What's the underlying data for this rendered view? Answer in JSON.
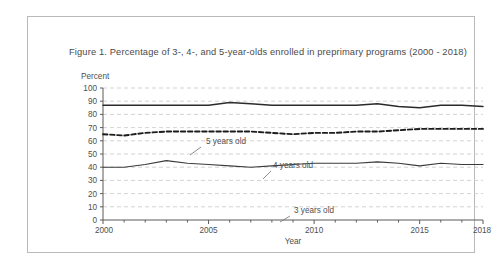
{
  "figure": {
    "title": "Figure 1.  Percentage of 3-, 4-, and 5-year-olds enrolled in preprimary programs (2000 - 2018)",
    "border_color": "#b9b9b9",
    "background": "#ffffff"
  },
  "chart_data": {
    "type": "line",
    "title": "Figure 1.  Percentage of 3-, 4-, and 5-year-olds enrolled in preprimary programs (2000 - 2018)",
    "xlabel": "Year",
    "ylabel": "Percent",
    "ylim": [
      0,
      100
    ],
    "xlim": [
      2000,
      2018
    ],
    "ytick_step": 10,
    "yticks": [
      0,
      10,
      20,
      30,
      40,
      50,
      60,
      70,
      80,
      90,
      100
    ],
    "xticks_major": [
      2000,
      2005,
      2010,
      2015,
      2018
    ],
    "xticks_minor_every": 1,
    "grid": "horizontal-dashed",
    "grid_color": "#c8c8c8",
    "legend": "inline-annotations",
    "x": [
      2000,
      2001,
      2002,
      2003,
      2004,
      2005,
      2006,
      2007,
      2008,
      2009,
      2010,
      2011,
      2012,
      2013,
      2014,
      2015,
      2016,
      2017,
      2018
    ],
    "series": [
      {
        "name": "5 years old",
        "style": "solid",
        "color": "#2b2b2b",
        "width": 1.5,
        "values": [
          87,
          87,
          87,
          87,
          87,
          87,
          89,
          88,
          87,
          87,
          87,
          87,
          87,
          88,
          86,
          85,
          87,
          87,
          86
        ]
      },
      {
        "name": "4 years old",
        "style": "dashed",
        "color": "#1c1c1c",
        "width": 1.9,
        "values": [
          65,
          64,
          66,
          67,
          67,
          67,
          67,
          67,
          66,
          65,
          66,
          66,
          67,
          67,
          68,
          69,
          69,
          69,
          69
        ]
      },
      {
        "name": "3 years old",
        "style": "solid",
        "color": "#3a3a3a",
        "width": 1.1,
        "values": [
          40,
          40,
          42,
          45,
          43,
          42,
          41,
          40,
          41,
          42,
          43,
          43,
          43,
          44,
          43,
          41,
          43,
          42,
          42
        ]
      }
    ],
    "annotations": [
      {
        "label": "5 years old",
        "label_x": 138,
        "label_y": 77,
        "leader": [
          [
            133,
            80
          ],
          [
            122,
            88
          ]
        ]
      },
      {
        "label": "4 years old",
        "label_x": 205,
        "label_y": 101,
        "leader": [
          [
            203,
            104
          ],
          [
            195,
            112
          ]
        ]
      },
      {
        "label": "3 years old",
        "label_x": 226,
        "label_y": 146,
        "leader": [
          [
            222,
            149
          ],
          [
            212,
            155
          ]
        ]
      }
    ]
  }
}
